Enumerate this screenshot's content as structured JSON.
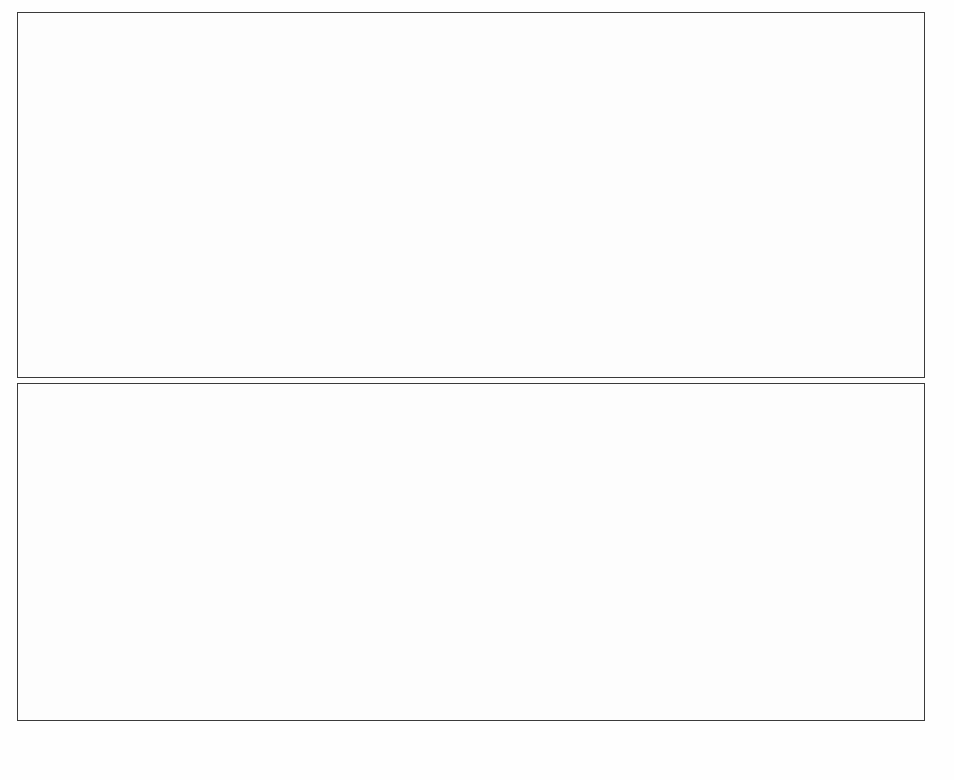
{
  "figure": {
    "background_color": "#fefefe",
    "frame_color": "#3a3a3a",
    "panels": [
      {
        "id": "panel-top",
        "name": "percentage-successful-trials-panel"
      },
      {
        "id": "panel-bottom",
        "name": "number-of-epochs-panel"
      }
    ]
  },
  "chart_data": [
    {
      "type": "bar",
      "id": "top",
      "title": "",
      "xlabel": "Number of Hidden Units",
      "ylabel": "Percentage of Sucessful Trials",
      "categories": [
        "2",
        "3",
        "4",
        "5",
        "6",
        "7",
        "8"
      ],
      "values": [
        60,
        98,
        100,
        100,
        100,
        100,
        100
      ],
      "ylim": [
        0,
        100
      ],
      "yticks": [
        0,
        10,
        20,
        30,
        40,
        50,
        60,
        70,
        80,
        90,
        100
      ],
      "ytick_labels": [
        "0",
        "10",
        "20",
        "30",
        "40",
        "50",
        "60",
        "70",
        "80",
        "90",
        "100"
      ],
      "xtick_labels": [
        "2",
        "3",
        "4",
        "5",
        "6",
        "7",
        "8"
      ],
      "minor_ticks_per_interval": 2,
      "bar_style": "filled",
      "bar_color": "#111111",
      "grid": false,
      "legend": false,
      "legend_position": "none",
      "error_bars": false
    },
    {
      "type": "bar",
      "id": "bottom",
      "title": "",
      "xlabel": "Number of Hidden Units",
      "ylabel": "Number of Epochs",
      "categories": [
        "2",
        "3",
        "4",
        "5",
        "6",
        "7",
        "8"
      ],
      "values": [
        1990,
        1860,
        1650,
        1510,
        1425,
        1350,
        1290
      ],
      "errors": [
        25,
        18,
        15,
        0,
        10,
        0,
        0
      ],
      "ylim": [
        0,
        2100
      ],
      "yticks": [
        0,
        500,
        1000,
        1500,
        2000
      ],
      "ytick_labels": [
        "0",
        "500",
        "1000",
        "1500",
        "2000"
      ],
      "xtick_labels": [
        "2",
        "3",
        "4",
        "5",
        "6",
        "7",
        "8"
      ],
      "minor_ticks_per_interval": 4,
      "bar_style": "hollow",
      "bar_fill": "#ffffff",
      "bar_stroke": "#1a1a1a",
      "grid": false,
      "legend": false,
      "legend_position": "none",
      "error_bars": true
    }
  ]
}
